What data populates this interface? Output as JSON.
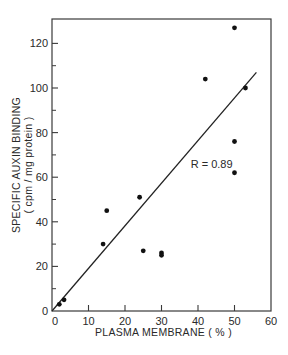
{
  "chart_data": {
    "type": "scatter",
    "title": "",
    "xlabel": "PLASMA MEMBRANE  ( % )",
    "ylabel": "SPECIFIC AUXIN BINDING",
    "ylabel_units": "( cpm / mg protein )",
    "xlim": [
      0,
      60
    ],
    "ylim": [
      0,
      130
    ],
    "x_ticks": [
      0,
      10,
      20,
      30,
      40,
      50,
      60
    ],
    "y_ticks": [
      0,
      20,
      40,
      60,
      80,
      100,
      120
    ],
    "y_minor_ticks": [
      10,
      30,
      50,
      70,
      90,
      110
    ],
    "grid": false,
    "legend": null,
    "points": [
      {
        "x": 2,
        "y": 3
      },
      {
        "x": 3.3,
        "y": 5
      },
      {
        "x": 14,
        "y": 30
      },
      {
        "x": 15,
        "y": 45
      },
      {
        "x": 24,
        "y": 51
      },
      {
        "x": 25,
        "y": 27
      },
      {
        "x": 30,
        "y": 26
      },
      {
        "x": 30,
        "y": 25
      },
      {
        "x": 42,
        "y": 104
      },
      {
        "x": 50,
        "y": 127
      },
      {
        "x": 50,
        "y": 76
      },
      {
        "x": 50,
        "y": 62
      },
      {
        "x": 53,
        "y": 100
      }
    ],
    "regression_line": {
      "x0": 0,
      "y0": 0,
      "x1": 56,
      "y1": 107
    },
    "annotations": [
      {
        "text": "R = 0.89",
        "x": 38,
        "y": 66
      }
    ]
  }
}
